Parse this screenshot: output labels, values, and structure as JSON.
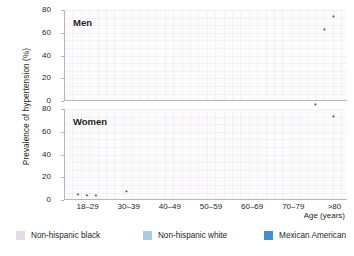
{
  "chart_data": {
    "type": "bar",
    "title": "",
    "xlabel": "Age (years)",
    "ylabel": "Prevalence of hypertension (%)",
    "ylim": [
      0,
      80
    ],
    "yticks": [
      0,
      20,
      40,
      60,
      80
    ],
    "grid": true,
    "legend_position": "bottom",
    "categories": [
      "18–29",
      "30–39",
      "40–49",
      "50–59",
      "60–69",
      "70–79",
      ">80"
    ],
    "panels": [
      {
        "name": "men",
        "label": "Men",
        "series": [
          {
            "name": "Non-hispanic black",
            "color": "#e4dbe4",
            "values": [
              6,
              11,
              36,
              55,
              63,
              67,
              62
            ],
            "stars": [
              false,
              false,
              false,
              false,
              false,
              false,
              false
            ]
          },
          {
            "name": "Non-hispanic white",
            "color": "#a8cbe8",
            "values": [
              3,
              12,
              22,
              41,
              50,
              60,
              60
            ],
            "stars": [
              false,
              false,
              false,
              false,
              false,
              false,
              true
            ]
          },
          {
            "name": "Mexican American",
            "color": "#3b93d4",
            "values": [
              2,
              9,
              21,
              36,
              54,
              52,
              71
            ],
            "stars": [
              false,
              false,
              false,
              false,
              false,
              false,
              true
            ]
          }
        ]
      },
      {
        "name": "women",
        "label": "Women",
        "series": [
          {
            "name": "Non-hispanic black",
            "color": "#e4dbe4",
            "values": [
              2,
              11,
              30,
              47,
              77,
              71,
              81
            ],
            "stars": [
              true,
              false,
              false,
              false,
              false,
              false,
              true
            ]
          },
          {
            "name": "Non-hispanic white",
            "color": "#a8cbe8",
            "values": [
              1,
              4,
              13,
              37,
              51,
              65,
              73
            ],
            "stars": [
              true,
              true,
              false,
              false,
              false,
              false,
              false
            ]
          },
          {
            "name": "Mexican American",
            "color": "#3b93d4",
            "values": [
              1,
              7,
              11,
              34,
              59,
              66,
              70
            ],
            "stars": [
              true,
              false,
              false,
              false,
              false,
              false,
              true
            ]
          }
        ]
      }
    ],
    "legend": [
      {
        "label": "Non-hispanic black",
        "color": "#e4dbe4"
      },
      {
        "label": "Non-hispanic white",
        "color": "#a8cbe8"
      },
      {
        "label": "Mexican American",
        "color": "#3b93d4"
      }
    ],
    "star_symbol": "*"
  }
}
